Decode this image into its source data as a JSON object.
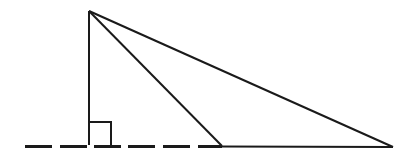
{
  "diagram": {
    "title": "",
    "elements": [
      {
        "id": "apex",
        "type": "point"
      },
      {
        "id": "foot",
        "type": "point",
        "note": "foot of perpendicular, marked with right angle"
      },
      {
        "id": "near-vertex",
        "type": "point"
      },
      {
        "id": "far-vertex",
        "type": "point"
      }
    ],
    "labels": [],
    "stroke_color": "#1a1a1a",
    "background_color": "#ffffff"
  }
}
